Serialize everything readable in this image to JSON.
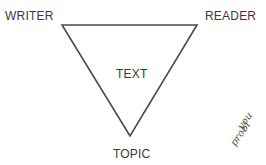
{
  "diagram": {
    "shape": "inverted-triangle",
    "stroke_color": "#444444",
    "vertices": {
      "top_left": "WRITER",
      "top_right": "READER",
      "bottom": "TOPIC"
    },
    "labels": {
      "writer": "WRITER",
      "reader": "READER",
      "center": "TEXT",
      "topic": "TOPIC"
    },
    "handwriting": {
      "line1": "you",
      "line2": "probl"
    }
  }
}
